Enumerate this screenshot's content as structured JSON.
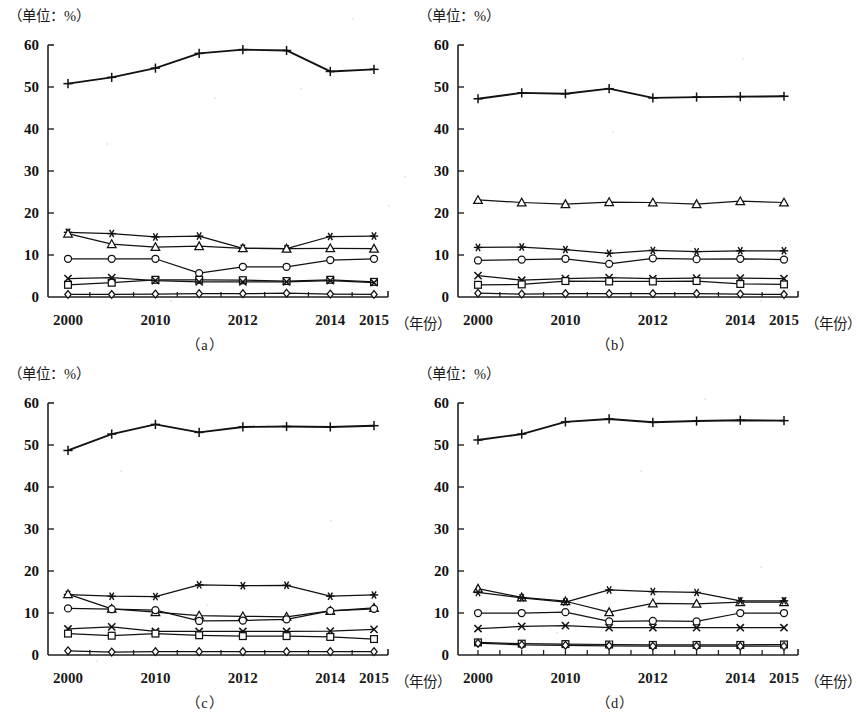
{
  "figure": {
    "unit_label": "（单位：%）",
    "x_unit_label": "（年份）",
    "y_ticks": [
      0,
      10,
      20,
      30,
      40,
      50,
      60
    ],
    "x_tick_labels": [
      {
        "index": 0,
        "label": "2000"
      },
      {
        "index": 2,
        "label": "2010"
      },
      {
        "index": 4,
        "label": "2012"
      },
      {
        "index": 6,
        "label": "2014"
      },
      {
        "index": 7,
        "label": "2015"
      }
    ],
    "line_color": "#111111",
    "axis_color": "#222222",
    "background": "#ffffff"
  },
  "chart_data": [
    {
      "id": "a",
      "type": "line",
      "title": "（a）",
      "caption": "（a）",
      "xlabel": "（年份）",
      "ylabel": "（单位：%）",
      "grid": false,
      "legend_position": "none",
      "ylim": [
        0,
        60
      ],
      "x": [
        2000,
        2005,
        2010,
        2011,
        2012,
        2013,
        2014,
        2015
      ],
      "categories": [
        "2000",
        "2005",
        "2010",
        "2011",
        "2012",
        "2013",
        "2014",
        "2015"
      ],
      "series": [
        {
          "name": "plus",
          "marker": "plus",
          "values": [
            50.8,
            52.3,
            54.5,
            58.0,
            58.9,
            58.7,
            53.7,
            54.2
          ]
        },
        {
          "name": "asterisk",
          "marker": "asterisk",
          "values": [
            15.4,
            15.1,
            14.3,
            14.5,
            11.6,
            11.5,
            14.4,
            14.5
          ]
        },
        {
          "name": "triangle",
          "marker": "triangle",
          "values": [
            15.1,
            12.6,
            11.9,
            12.1,
            11.6,
            11.5,
            11.6,
            11.5
          ]
        },
        {
          "name": "circle",
          "marker": "circle",
          "values": [
            9.1,
            9.1,
            9.1,
            5.7,
            7.2,
            7.2,
            8.8,
            9.1
          ]
        },
        {
          "name": "square",
          "marker": "square",
          "values": [
            2.9,
            3.4,
            4.1,
            4.1,
            4.0,
            3.8,
            4.1,
            3.6
          ]
        },
        {
          "name": "cross",
          "marker": "cross",
          "values": [
            4.4,
            4.6,
            3.9,
            3.6,
            3.6,
            3.6,
            3.9,
            3.4
          ]
        },
        {
          "name": "diamond",
          "marker": "diamond",
          "values": [
            0.6,
            0.6,
            0.7,
            0.8,
            0.8,
            0.9,
            0.7,
            0.6
          ]
        }
      ]
    },
    {
      "id": "b",
      "type": "line",
      "title": "（b）",
      "caption": "（b）",
      "xlabel": "（年份）",
      "ylabel": "（单位：%）",
      "grid": false,
      "legend_position": "none",
      "ylim": [
        0,
        60
      ],
      "x": [
        2000,
        2005,
        2010,
        2011,
        2012,
        2013,
        2014,
        2015
      ],
      "categories": [
        "2000",
        "2005",
        "2010",
        "2011",
        "2012",
        "2013",
        "2014",
        "2015"
      ],
      "series": [
        {
          "name": "plus",
          "marker": "plus",
          "values": [
            47.2,
            48.6,
            48.4,
            49.6,
            47.4,
            47.6,
            47.7,
            47.8
          ]
        },
        {
          "name": "triangle",
          "marker": "triangle",
          "values": [
            23.1,
            22.5,
            22.1,
            22.6,
            22.5,
            22.1,
            22.8,
            22.5
          ]
        },
        {
          "name": "asterisk",
          "marker": "asterisk",
          "values": [
            11.8,
            11.9,
            11.3,
            10.4,
            11.1,
            10.8,
            11.0,
            11.0
          ]
        },
        {
          "name": "circle",
          "marker": "circle",
          "values": [
            8.7,
            8.9,
            9.1,
            7.9,
            9.2,
            9.0,
            9.1,
            8.9
          ]
        },
        {
          "name": "cross",
          "marker": "cross",
          "values": [
            5.1,
            4.0,
            4.4,
            4.6,
            4.4,
            4.5,
            4.5,
            4.4
          ]
        },
        {
          "name": "square",
          "marker": "square",
          "values": [
            2.9,
            3.0,
            3.8,
            3.7,
            3.7,
            3.8,
            3.1,
            3.0
          ]
        },
        {
          "name": "diamond",
          "marker": "diamond",
          "values": [
            0.9,
            0.7,
            0.8,
            0.8,
            0.8,
            0.8,
            0.7,
            0.6
          ]
        }
      ]
    },
    {
      "id": "c",
      "type": "line",
      "title": "（c）",
      "caption": "（c）",
      "xlabel": "（年份）",
      "ylabel": "（单位：%）",
      "grid": false,
      "legend_position": "none",
      "ylim": [
        0,
        60
      ],
      "x": [
        2000,
        2005,
        2010,
        2011,
        2012,
        2013,
        2014,
        2015
      ],
      "categories": [
        "2000",
        "2005",
        "2010",
        "2011",
        "2012",
        "2013",
        "2014",
        "2015"
      ],
      "series": [
        {
          "name": "plus",
          "marker": "plus",
          "values": [
            48.7,
            52.6,
            54.9,
            53.0,
            54.3,
            54.4,
            54.3,
            54.6
          ]
        },
        {
          "name": "asterisk",
          "marker": "asterisk",
          "values": [
            14.4,
            14.0,
            13.9,
            16.7,
            16.5,
            16.6,
            14.0,
            14.3
          ]
        },
        {
          "name": "triangle",
          "marker": "triangle",
          "values": [
            14.5,
            11.0,
            10.2,
            9.4,
            9.2,
            9.1,
            10.5,
            11.2
          ]
        },
        {
          "name": "circle",
          "marker": "circle",
          "values": [
            11.1,
            10.9,
            10.7,
            8.1,
            8.2,
            8.5,
            10.5,
            11.0
          ]
        },
        {
          "name": "cross",
          "marker": "cross",
          "values": [
            6.2,
            6.7,
            5.6,
            5.6,
            5.6,
            5.6,
            5.7,
            6.1
          ]
        },
        {
          "name": "square",
          "marker": "square",
          "values": [
            5.1,
            4.6,
            5.1,
            4.7,
            4.5,
            4.5,
            4.3,
            3.8
          ]
        },
        {
          "name": "diamond",
          "marker": "diamond",
          "values": [
            1.0,
            0.7,
            0.8,
            0.8,
            0.8,
            0.8,
            0.8,
            0.8
          ]
        }
      ]
    },
    {
      "id": "d",
      "type": "line",
      "title": "（d）",
      "caption": "（d）",
      "xlabel": "（年份）",
      "ylabel": "（单位：%）",
      "grid": false,
      "legend_position": "none",
      "ylim": [
        0,
        60
      ],
      "x": [
        2000,
        2005,
        2010,
        2011,
        2012,
        2013,
        2014,
        2015
      ],
      "categories": [
        "2000",
        "2005",
        "2010",
        "2011",
        "2012",
        "2013",
        "2014",
        "2015"
      ],
      "series": [
        {
          "name": "plus",
          "marker": "plus",
          "values": [
            51.2,
            52.6,
            55.5,
            56.2,
            55.4,
            55.7,
            55.9,
            55.8
          ]
        },
        {
          "name": "triangle",
          "marker": "triangle",
          "values": [
            15.8,
            13.7,
            12.8,
            10.2,
            12.3,
            12.2,
            12.6,
            12.6
          ]
        },
        {
          "name": "asterisk",
          "marker": "asterisk",
          "values": [
            14.9,
            13.6,
            12.6,
            15.5,
            15.1,
            14.9,
            12.9,
            12.9
          ]
        },
        {
          "name": "circle",
          "marker": "circle",
          "values": [
            10.0,
            10.0,
            10.2,
            8.0,
            8.1,
            8.0,
            10.0,
            10.0
          ]
        },
        {
          "name": "cross",
          "marker": "cross",
          "values": [
            6.3,
            6.8,
            7.0,
            6.5,
            6.5,
            6.5,
            6.5,
            6.5
          ]
        },
        {
          "name": "square",
          "marker": "square",
          "values": [
            3.0,
            2.7,
            2.6,
            2.5,
            2.4,
            2.4,
            2.4,
            2.5
          ]
        },
        {
          "name": "diamond",
          "marker": "diamond",
          "values": [
            2.8,
            2.4,
            2.3,
            2.2,
            2.1,
            2.1,
            2.1,
            2.1
          ]
        }
      ]
    }
  ]
}
